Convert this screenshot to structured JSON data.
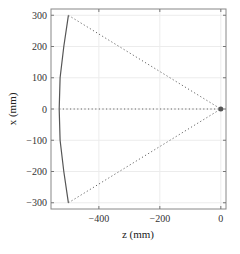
{
  "chart_data": {
    "type": "line",
    "title": "",
    "xlabel": "z (mm)",
    "ylabel": "x (mm)",
    "xlim": [
      -557,
      17
    ],
    "ylim": [
      -320,
      320
    ],
    "grid": true,
    "legend": null,
    "x_ticks": [
      -400,
      -200,
      0
    ],
    "x_tick_labels": [
      "-400",
      "-200",
      "0"
    ],
    "y_ticks": [
      300,
      200,
      100,
      0,
      -100,
      -200,
      -300
    ],
    "y_tick_labels": [
      "300",
      "200",
      "100",
      "0",
      "-100",
      "-200",
      "-300"
    ],
    "series": [
      {
        "name": "curved surface",
        "style": "solid",
        "color": "#555555",
        "points": [
          [
            -500,
            300
          ],
          [
            -515,
            200
          ],
          [
            -527,
            100
          ],
          [
            -530,
            0
          ],
          [
            -527,
            -100
          ],
          [
            -515,
            -200
          ],
          [
            -500,
            -300
          ]
        ]
      },
      {
        "name": "ray upper",
        "style": "dotted",
        "color": "#666666",
        "points": [
          [
            -500,
            300
          ],
          [
            0,
            0
          ]
        ]
      },
      {
        "name": "ray axis",
        "style": "dotted",
        "color": "#666666",
        "points": [
          [
            -530,
            0
          ],
          [
            0,
            0
          ]
        ]
      },
      {
        "name": "ray lower",
        "style": "dotted",
        "color": "#666666",
        "points": [
          [
            -500,
            -300
          ],
          [
            0,
            0
          ]
        ]
      }
    ],
    "annotations": [
      {
        "type": "marker",
        "label": "focal point",
        "point": [
          0,
          0
        ],
        "color": "#555555"
      }
    ]
  }
}
